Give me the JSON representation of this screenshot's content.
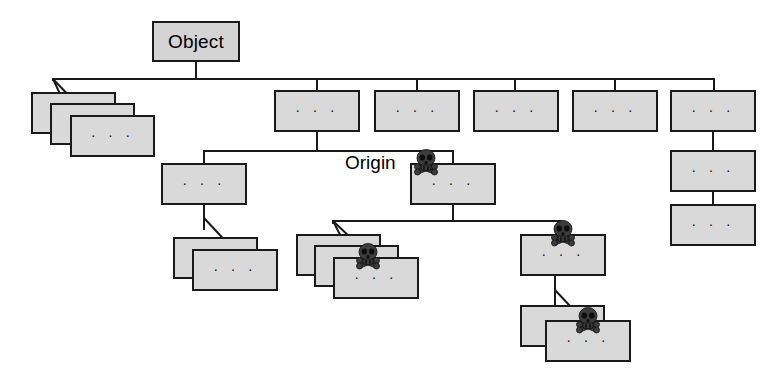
{
  "diagram": {
    "type": "tree",
    "root_label": "Object",
    "origin_label": "Origin",
    "ellipsis": "· · ·",
    "colors": {
      "box_fill": "#d9d9d9",
      "box_border": "#1a1a1a",
      "edge": "#1a1a1a",
      "skull": "#3c3c3c",
      "background": "#ffffff",
      "text": "#000000"
    },
    "legend": {
      "skull_meaning": "skull-and-crossbones marks a node on the tainted path",
      "ellipsis_meaning": "elided subtree contents"
    },
    "nodes": [
      {
        "id": "root",
        "label": "Object",
        "kind": "root",
        "skull": false,
        "stack": 1
      },
      {
        "id": "l1-stack",
        "label": "· · ·",
        "kind": "stack",
        "skull": false,
        "stack": 3
      },
      {
        "id": "l1-b",
        "label": "· · ·",
        "kind": "box",
        "skull": false,
        "stack": 1
      },
      {
        "id": "l1-c",
        "label": "· · ·",
        "kind": "box",
        "skull": false,
        "stack": 1
      },
      {
        "id": "l1-d",
        "label": "· · ·",
        "kind": "box",
        "skull": false,
        "stack": 1
      },
      {
        "id": "l1-e",
        "label": "· · ·",
        "kind": "box",
        "skull": false,
        "stack": 1
      },
      {
        "id": "l1-f",
        "label": "· · ·",
        "kind": "box",
        "skull": false,
        "stack": 1
      },
      {
        "id": "l2-left",
        "label": "· · ·",
        "kind": "box",
        "skull": false,
        "stack": 1
      },
      {
        "id": "l2-origin",
        "label": "· · ·",
        "kind": "box",
        "skull": true,
        "stack": 1
      },
      {
        "id": "l2-right-a",
        "label": "· · ·",
        "kind": "box",
        "skull": false,
        "stack": 1
      },
      {
        "id": "l2-right-b",
        "label": "· · ·",
        "kind": "box",
        "skull": false,
        "stack": 1
      },
      {
        "id": "l3-leftstack",
        "label": "· · ·",
        "kind": "stack",
        "skull": false,
        "stack": 2
      },
      {
        "id": "l3-midstack",
        "label": "· · ·",
        "kind": "stack",
        "skull": true,
        "stack": 3
      },
      {
        "id": "l3-right",
        "label": "· · ·",
        "kind": "box",
        "skull": true,
        "stack": 1
      },
      {
        "id": "l4-rightstack",
        "label": "· · ·",
        "kind": "stack",
        "skull": true,
        "stack": 2
      }
    ],
    "counts": {
      "total_boxes": 21,
      "skull_marked": 4,
      "stacks": 4,
      "levels": 5
    }
  }
}
